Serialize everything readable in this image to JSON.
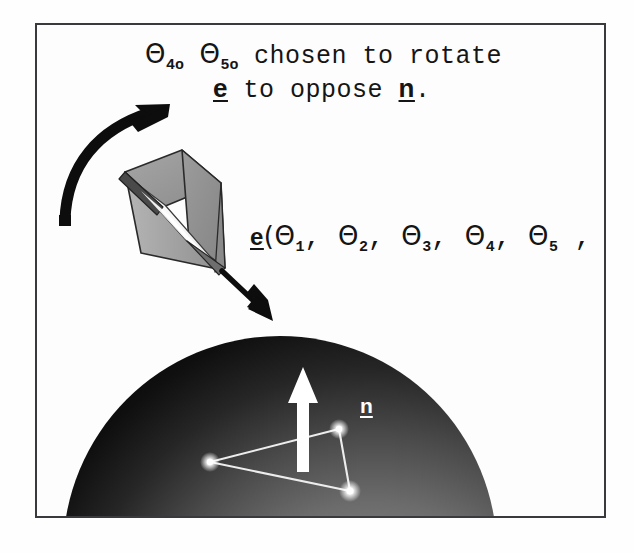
{
  "figure": {
    "background_color": "#fefefe",
    "frame_color": "#3a3a3e",
    "caption_line_1": {
      "theta_1_symbol": "Θ",
      "theta_1_subscript": "4o",
      "theta_2_symbol": "Θ",
      "theta_2_subscript": "5o",
      "words": "chosen to rotate"
    },
    "caption_line_2": {
      "vector_e": "e",
      "words_mid": "to oppose",
      "vector_n": "n",
      "period": "."
    },
    "vector_expression": {
      "vector_e": "e",
      "open_paren": "(",
      "theta_symbol": "Θ",
      "subscripts": [
        "1",
        "2",
        "3",
        "4",
        "5",
        "6"
      ],
      "separator": ",",
      "close_paren": ")"
    },
    "normal_label": "n",
    "shapes": {
      "sphere": {
        "name": "shaded-sphere",
        "dark_color": "#090909",
        "mid_color": "#4d4d4d",
        "light_color": "#8e8e8e"
      },
      "frustum": {
        "name": "viewing-frustum",
        "outer_color": "#9a9a9a",
        "inner_color": "#f6f6f6",
        "edge_color": "#1c1c1c"
      },
      "curved_arrow": {
        "name": "rotation-arrow",
        "color": "#0d0d0d"
      },
      "e_arrow": {
        "name": "e-direction-arrow",
        "color": "#0d0d0d"
      },
      "normal_arrow": {
        "name": "surface-normal-arrow",
        "color": "#ffffff"
      },
      "triangle": {
        "name": "surface-triangle",
        "color": "#f2f2f2",
        "vertex_count": 3
      }
    }
  }
}
